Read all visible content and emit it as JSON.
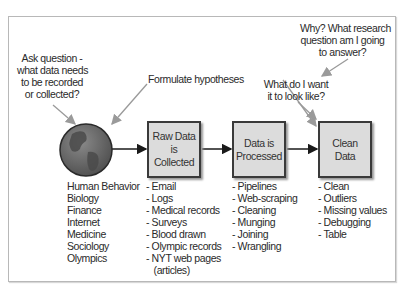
{
  "diagram": {
    "annotations": {
      "ask_question": [
        "Ask question -",
        "what data needs",
        "to be recorded",
        "or collected?"
      ],
      "formulate": "Formulate hypotheses",
      "why": [
        "Why? What research",
        "question am I going",
        "to answer?"
      ],
      "look_like": [
        "What do I want",
        "it to look like?"
      ]
    },
    "globe": {
      "icon": "globe-icon"
    },
    "boxes": [
      {
        "label": "Raw Data is\nCollected"
      },
      {
        "label": "Data is\nProcessed"
      },
      {
        "label": "Clean\nData"
      }
    ],
    "lists": {
      "domains": [
        "Human Behavior",
        "Biology",
        "Finance",
        "Internet",
        "Medicine",
        "Sociology",
        "Olympics"
      ],
      "raw_data": [
        "- Email",
        "- Logs",
        "- Medical records",
        "- Surveys",
        "- Blood drawn",
        "- Olympic records",
        "- NYT web pages",
        "   (articles)"
      ],
      "processed": [
        "- Pipelines",
        "- Web-scraping",
        "- Cleaning",
        "- Munging",
        "- Joining",
        "- Wrangling"
      ],
      "clean": [
        "- Clean",
        "- Outliers",
        "- Missing values",
        "- Debugging",
        "- Table"
      ]
    },
    "colors": {
      "box_fill": "#dcdcdc",
      "box_border": "#3a3a3a",
      "arrow_gray": "#9a9a9a",
      "globe_ocean": "#6f6f6f",
      "globe_land": "#4a4a4a"
    }
  }
}
